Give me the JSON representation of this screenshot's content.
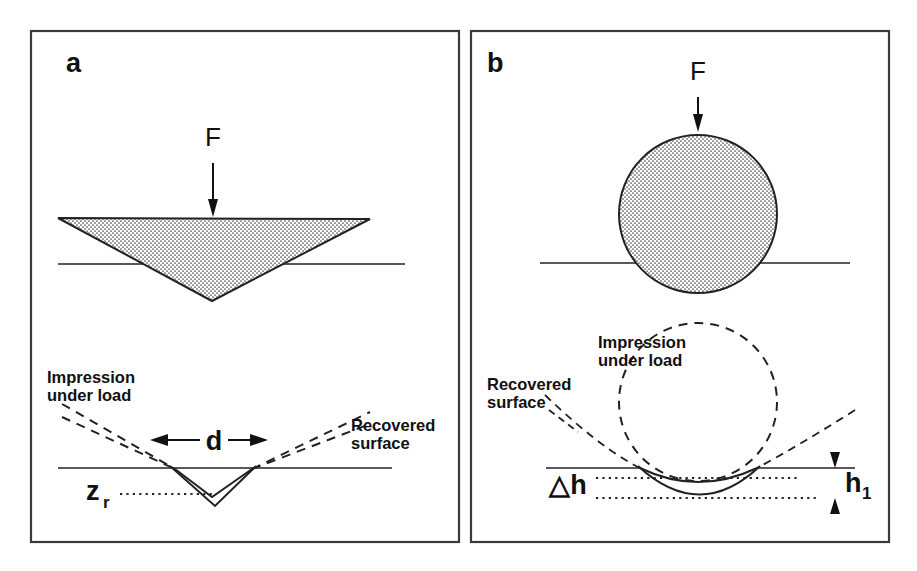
{
  "figure": {
    "panels": [
      {
        "id": "a",
        "label": "a",
        "indenter_type": "pyramid-triangle",
        "force_label": "F",
        "annotations": {
          "impression_under_load": "Impression\nunder load",
          "impression_line1": "Impression",
          "impression_line2": "under load",
          "recovered_surface": "Recovered\nsurface",
          "recovered_line1": "Recovered",
          "recovered_line2": "surface",
          "diagonal_label": "d",
          "depth_label": "z",
          "depth_subscript": "r"
        }
      },
      {
        "id": "b",
        "label": "b",
        "indenter_type": "sphere-ball",
        "force_label": "F",
        "annotations": {
          "impression_under_load": "Impression\nunder load",
          "impression_line1": "Impression",
          "impression_line2": "under load",
          "recovered_surface": "Recovered\nsurface",
          "recovered_line1": "Recovered",
          "recovered_line2": "surface",
          "delta_h_label": "△h",
          "h1_label": "h",
          "h1_subscript": "1"
        }
      }
    ]
  },
  "colors": {
    "background": "#ffffff",
    "ink": "#111111",
    "line": "#222222",
    "frame": "#3a3a3a",
    "stipple": "#555555"
  }
}
